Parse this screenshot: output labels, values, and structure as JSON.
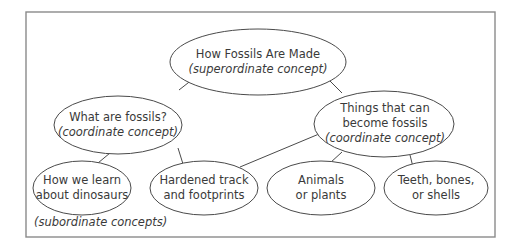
{
  "diagram": {
    "title": "How Fossils Are Made",
    "colors": {
      "background": "#ffffff",
      "frame": "#8a8a8a",
      "stroke": "#4a4a4a",
      "text": "#3a3a3a"
    },
    "nodes": {
      "root": {
        "lines": [
          "How Fossils Are Made"
        ],
        "tag": "(superordinate concept)",
        "level": "superordinate"
      },
      "what_are_fossils": {
        "lines": [
          "What are fossils?"
        ],
        "tag": "(coordinate concept)",
        "level": "coordinate"
      },
      "things_that_can": {
        "lines": [
          "Things that can",
          "become fossils"
        ],
        "tag": "(coordinate concept)",
        "level": "coordinate"
      },
      "how_we_learn": {
        "lines": [
          "How we learn",
          "about dinosaurs"
        ],
        "level": "subordinate"
      },
      "hardened_track": {
        "lines": [
          "Hardened track",
          "and footprints"
        ],
        "level": "subordinate"
      },
      "animals_plants": {
        "lines": [
          "Animals",
          "or plants"
        ],
        "level": "subordinate"
      },
      "teeth_bones": {
        "lines": [
          "Teeth, bones,",
          "or shells"
        ],
        "level": "subordinate"
      }
    },
    "edges": [
      {
        "from": "root",
        "to": "what_are_fossils"
      },
      {
        "from": "root",
        "to": "things_that_can"
      },
      {
        "from": "what_are_fossils",
        "to": "how_we_learn"
      },
      {
        "from": "what_are_fossils",
        "to": "hardened_track"
      },
      {
        "from": "things_that_can",
        "to": "hardened_track"
      },
      {
        "from": "things_that_can",
        "to": "animals_plants"
      },
      {
        "from": "things_that_can",
        "to": "teeth_bones"
      }
    ],
    "footnote": "(subordinate concepts)"
  }
}
